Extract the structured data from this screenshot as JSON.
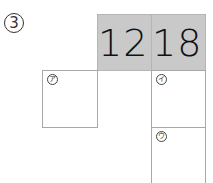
{
  "problem": {
    "number": "3",
    "number_display": "③"
  },
  "header_cells": [
    {
      "value": "12"
    },
    {
      "value": "18"
    }
  ],
  "boxes": [
    {
      "label": "ア",
      "label_display": "㋐"
    },
    {
      "label": "イ",
      "label_display": "㋑"
    },
    {
      "label": "ウ",
      "label_display": "㋒"
    }
  ],
  "colors": {
    "header_fill": "#c9c9c9",
    "box_border": "#a8a8a8",
    "text": "#111111"
  }
}
